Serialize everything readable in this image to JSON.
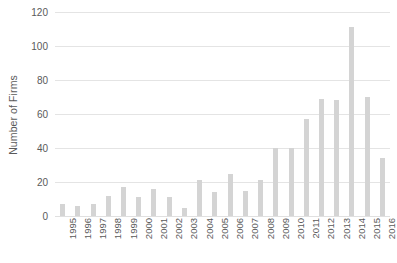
{
  "chart_data": {
    "type": "bar",
    "title": "",
    "subtitle": "",
    "xlabel": "",
    "ylabel": "Number of Firms",
    "ylim": [
      0,
      120
    ],
    "yticks": [
      0,
      20,
      40,
      60,
      80,
      100,
      120
    ],
    "ytick_labels": [
      "0",
      "20",
      "40",
      "60",
      "80",
      "100",
      "120"
    ],
    "grid": true,
    "legend": false,
    "legend_position": "none",
    "bar_color": "#d4d4d4",
    "categories": [
      "1995",
      "1996",
      "1997",
      "1998",
      "1999",
      "2000",
      "2001",
      "2002",
      "2003",
      "2004",
      "2005",
      "2006",
      "2007",
      "2008",
      "2009",
      "2010",
      "2011",
      "2012",
      "2013",
      "2014",
      "2015",
      "2016"
    ],
    "values": [
      7,
      6,
      7,
      12,
      17,
      11,
      16,
      11,
      5,
      21,
      14,
      25,
      15,
      21,
      40,
      40,
      57,
      69,
      68,
      111,
      70,
      34
    ]
  }
}
